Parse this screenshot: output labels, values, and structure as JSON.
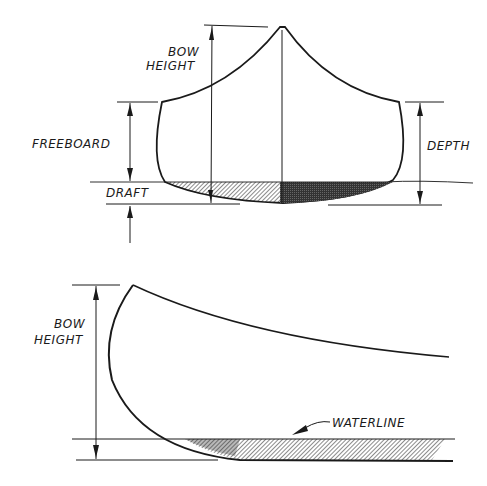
{
  "front_view": {
    "labels": {
      "bow_height_line1": "BOW",
      "bow_height_line2": "HEIGHT",
      "freeboard": "FREEBOARD",
      "draft": "DRAFT",
      "depth": "DEPTH"
    }
  },
  "side_view": {
    "labels": {
      "bow_height_line1": "BOW",
      "bow_height_line2": "HEIGHT",
      "waterline": "WATERLINE"
    }
  },
  "colors": {
    "ink": "#1a1a1a",
    "background": "#ffffff"
  }
}
